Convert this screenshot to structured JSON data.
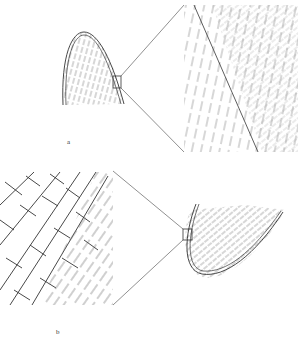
{
  "figure": {
    "panels": [
      {
        "id": "a",
        "label": "a",
        "description": "Arch-shaped fold outline with hatching; small boxed region on right limb magnified in wedge view showing a diagonal line through hatched strata"
      },
      {
        "id": "b",
        "label": "b",
        "description": "Hook-shaped fold outline with hatching; small boxed region magnified in wedge view showing block-like brick pattern next to inclined strata"
      }
    ],
    "colors": {
      "line": "#333333",
      "hatch": "#777777",
      "background": "#ffffff"
    }
  }
}
